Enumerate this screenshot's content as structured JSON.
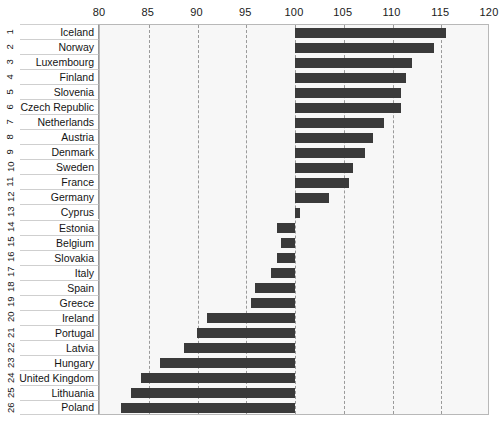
{
  "chart_data": {
    "type": "bar",
    "orientation": "horizontal",
    "title": "",
    "subtitle": "",
    "xlabel": "",
    "ylabel": "",
    "xlim": [
      80,
      120
    ],
    "baseline": 100,
    "grid": true,
    "legend": null,
    "xticks": [
      80,
      85,
      90,
      95,
      100,
      105,
      110,
      115,
      120
    ],
    "xticklabels": [
      "80",
      "85",
      "90",
      "95",
      "100",
      "105",
      "110",
      "115",
      "120"
    ],
    "row_indices": [
      "1",
      "2",
      "3",
      "4",
      "5",
      "6",
      "7",
      "8",
      "9",
      "10",
      "11",
      "12",
      "13",
      "14",
      "15",
      "16",
      "17",
      "18",
      "19",
      "20",
      "21",
      "22",
      "23",
      "24",
      "25",
      "26"
    ],
    "categories": [
      "Iceland",
      "Norway",
      "Luxembourg",
      "Finland",
      "Slovenia",
      "Czech Republic",
      "Netherlands",
      "Austria",
      "Denmark",
      "Sweden",
      "France",
      "Germany",
      "Cyprus",
      "Estonia",
      "Belgium",
      "Slovakia",
      "Italy",
      "Spain",
      "Greece",
      "Ireland",
      "Portugal",
      "Latvia",
      "Hungary",
      "United Kingdom",
      "Lithuania",
      "Poland"
    ],
    "values": [
      115.5,
      114.3,
      112.0,
      111.4,
      110.9,
      110.9,
      109.1,
      108.0,
      107.2,
      105.9,
      105.5,
      103.5,
      100.5,
      98.2,
      98.6,
      98.2,
      97.5,
      95.9,
      95.5,
      91.0,
      89.9,
      88.6,
      86.2,
      84.2,
      83.2,
      82.2
    ],
    "colors": {
      "bar": "#3a3a3a",
      "plot_background": "#f7f7f7",
      "gridline": "#9a9a9a",
      "axis_text": "#1a1a1a",
      "label_background": "#ffffff",
      "label_border": "#cfcfcf",
      "page_background": "#ffffff"
    }
  }
}
